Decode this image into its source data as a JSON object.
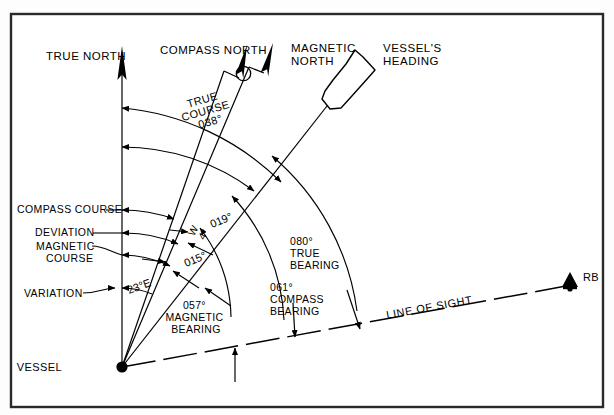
{
  "figure": {
    "title_hidden": "Compass error diagram",
    "frame": {
      "stroke": "#1a1a1a",
      "fill": "#ffffff"
    },
    "ink": "#000000"
  },
  "north_references": [
    {
      "key": "true_north",
      "label": "TRUE NORTH",
      "bearing_deg": 0,
      "name": "true-north-arrow"
    },
    {
      "key": "compass_north",
      "label": "COMPASS NORTH",
      "bearing_deg": 19,
      "name": "compass-north-arrow"
    },
    {
      "key": "magnetic_north",
      "label": "MAGNETIC NORTH",
      "bearing_deg": 23,
      "name": "magnetic-north-arrow"
    }
  ],
  "vessel": {
    "origin_label": "VESSEL",
    "heading_label": "VESSEL'S HEADING",
    "heading_deg": 38
  },
  "courses": [
    {
      "key": "compass_course",
      "label": "COMPASS COURSE",
      "value": "019°"
    },
    {
      "key": "magnetic_course",
      "label": "MAGNETIC COURSE",
      "value": "015°"
    },
    {
      "key": "true_course",
      "label": "TRUE COURSE",
      "value": "038°"
    }
  ],
  "errors": [
    {
      "key": "deviation",
      "label": "DEVIATION",
      "value": "W 4°",
      "value_line1": "W",
      "value_line2": "4°"
    },
    {
      "key": "variation",
      "label": "VARIATION",
      "value": "23°E"
    }
  ],
  "bearings": [
    {
      "key": "true_bearing",
      "value": "080°",
      "label_line1": "TRUE",
      "label_line2": "BEARING"
    },
    {
      "key": "compass_bearing",
      "value": "061°",
      "label_line1": "COMPASS",
      "label_line2": "BEARING"
    },
    {
      "key": "magnetic_bearing",
      "value": "057°",
      "label_line1": "MAGNETIC",
      "label_line2": "BEARING"
    }
  ],
  "sight": {
    "line_label": "LINE OF SIGHT",
    "target_label": "RB"
  },
  "arc_labels": {
    "true_course_line1": "TRUE",
    "true_course_line2": "COURSE",
    "true_course_line3": "038°",
    "compass_course_value": "019°",
    "magnetic_course_value": "015°",
    "deviation_w": "W",
    "deviation_4": "4°",
    "variation_value": "23°E"
  }
}
